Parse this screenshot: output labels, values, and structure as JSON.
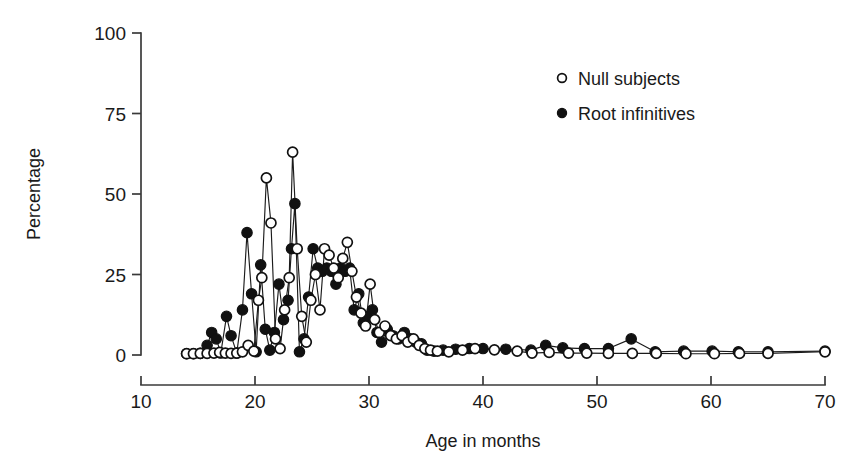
{
  "chart_data": {
    "type": "scatter",
    "title": "",
    "xlabel": "Age in months",
    "ylabel": "Percentage",
    "xlim": [
      10,
      70
    ],
    "ylim": [
      0,
      100
    ],
    "xticks": [
      10,
      20,
      30,
      40,
      50,
      60,
      70
    ],
    "yticks": [
      0,
      25,
      50,
      75,
      100
    ],
    "xtick_labels": [
      "10",
      "20",
      "30",
      "40",
      "50",
      "60",
      "70"
    ],
    "ytick_labels": [
      "0",
      "25",
      "50",
      "75",
      "100"
    ],
    "grid": false,
    "legend_position": "upper right",
    "marker_style": {
      "null_subjects": "open-circle",
      "root_infinitives": "filled-circle"
    },
    "series": [
      {
        "name": "Null subjects",
        "marker": "open-circle",
        "color": "#111111",
        "points": [
          [
            14.0,
            0.4
          ],
          [
            14.6,
            0.4
          ],
          [
            15.2,
            0.5
          ],
          [
            15.8,
            0.5
          ],
          [
            16.4,
            0.6
          ],
          [
            16.9,
            0.8
          ],
          [
            17.4,
            0.6
          ],
          [
            17.9,
            0.5
          ],
          [
            18.4,
            0.6
          ],
          [
            18.9,
            1.0
          ],
          [
            19.4,
            3.0
          ],
          [
            19.9,
            1.2
          ],
          [
            20.3,
            17.0
          ],
          [
            20.6,
            24.0
          ],
          [
            21.0,
            55.0
          ],
          [
            21.4,
            41.0
          ],
          [
            21.8,
            5.0
          ],
          [
            22.2,
            2.0
          ],
          [
            22.6,
            14.0
          ],
          [
            23.0,
            24.0
          ],
          [
            23.3,
            63.0
          ],
          [
            23.7,
            33.0
          ],
          [
            24.1,
            12.0
          ],
          [
            24.5,
            4.0
          ],
          [
            24.9,
            17.0
          ],
          [
            25.3,
            25.0
          ],
          [
            25.7,
            14.0
          ],
          [
            26.1,
            33.0
          ],
          [
            26.5,
            31.0
          ],
          [
            26.9,
            27.0
          ],
          [
            27.3,
            24.0
          ],
          [
            27.7,
            30.0
          ],
          [
            28.1,
            35.0
          ],
          [
            28.5,
            26.0
          ],
          [
            28.9,
            18.0
          ],
          [
            29.3,
            13.0
          ],
          [
            29.7,
            9.0
          ],
          [
            30.1,
            22.0
          ],
          [
            30.5,
            11.0
          ],
          [
            30.9,
            7.0
          ],
          [
            31.4,
            9.0
          ],
          [
            31.9,
            6.0
          ],
          [
            32.4,
            5.0
          ],
          [
            32.9,
            6.0
          ],
          [
            33.4,
            4.0
          ],
          [
            33.9,
            5.0
          ],
          [
            34.4,
            3.0
          ],
          [
            34.9,
            2.0
          ],
          [
            35.4,
            1.5
          ],
          [
            36.0,
            1.2
          ],
          [
            37.0,
            1.0
          ],
          [
            38.2,
            1.5
          ],
          [
            39.3,
            2.0
          ],
          [
            41.0,
            1.6
          ],
          [
            43.0,
            1.2
          ],
          [
            44.3,
            0.6
          ],
          [
            45.8,
            0.8
          ],
          [
            47.5,
            0.6
          ],
          [
            49.1,
            0.6
          ],
          [
            51.0,
            0.5
          ],
          [
            53.1,
            0.5
          ],
          [
            55.2,
            0.5
          ],
          [
            57.8,
            0.4
          ],
          [
            60.3,
            0.4
          ],
          [
            62.5,
            0.5
          ],
          [
            65.0,
            0.5
          ],
          [
            70.0,
            1.0
          ]
        ]
      },
      {
        "name": "Root infinitives",
        "marker": "filled-circle",
        "color": "#111111",
        "points": [
          [
            14.0,
            0.4
          ],
          [
            14.6,
            0.4
          ],
          [
            15.2,
            0.5
          ],
          [
            15.8,
            3.0
          ],
          [
            16.2,
            7.0
          ],
          [
            16.6,
            5.0
          ],
          [
            17.0,
            0.6
          ],
          [
            17.5,
            12.0
          ],
          [
            17.9,
            6.0
          ],
          [
            18.4,
            0.6
          ],
          [
            18.9,
            14.0
          ],
          [
            19.3,
            38.0
          ],
          [
            19.7,
            19.0
          ],
          [
            20.1,
            1.0
          ],
          [
            20.5,
            28.0
          ],
          [
            20.9,
            8.0
          ],
          [
            21.3,
            1.5
          ],
          [
            21.7,
            7.0
          ],
          [
            22.1,
            22.0
          ],
          [
            22.5,
            11.0
          ],
          [
            22.9,
            17.0
          ],
          [
            23.2,
            33.0
          ],
          [
            23.5,
            47.0
          ],
          [
            23.9,
            1.0
          ],
          [
            24.3,
            5.0
          ],
          [
            24.7,
            18.0
          ],
          [
            25.1,
            33.0
          ],
          [
            25.5,
            27.0
          ],
          [
            25.9,
            26.0
          ],
          [
            26.3,
            27.0
          ],
          [
            26.7,
            26.0
          ],
          [
            27.1,
            22.0
          ],
          [
            27.5,
            27.0
          ],
          [
            27.9,
            26.0
          ],
          [
            28.3,
            27.0
          ],
          [
            28.7,
            14.0
          ],
          [
            29.1,
            19.0
          ],
          [
            29.5,
            10.0
          ],
          [
            29.9,
            12.0
          ],
          [
            30.3,
            14.0
          ],
          [
            30.7,
            7.0
          ],
          [
            31.1,
            4.0
          ],
          [
            31.6,
            8.0
          ],
          [
            32.1,
            6.0
          ],
          [
            32.6,
            5.0
          ],
          [
            33.1,
            7.0
          ],
          [
            33.6,
            5.0
          ],
          [
            34.1,
            4.0
          ],
          [
            34.6,
            3.5
          ],
          [
            35.1,
            1.5
          ],
          [
            35.7,
            1.2
          ],
          [
            36.5,
            1.5
          ],
          [
            37.6,
            1.8
          ],
          [
            38.8,
            2.0
          ],
          [
            40.0,
            2.0
          ],
          [
            42.0,
            1.8
          ],
          [
            44.2,
            1.5
          ],
          [
            45.5,
            3.0
          ],
          [
            47.0,
            2.2
          ],
          [
            48.9,
            2.0
          ],
          [
            51.0,
            2.0
          ],
          [
            53.0,
            5.0
          ],
          [
            55.1,
            1.0
          ],
          [
            57.6,
            1.2
          ],
          [
            60.1,
            1.2
          ],
          [
            62.4,
            1.0
          ],
          [
            65.0,
            1.0
          ],
          [
            70.0,
            1.2
          ]
        ]
      }
    ]
  },
  "legend": {
    "items": [
      {
        "label": "Null subjects",
        "marker": "open-circle"
      },
      {
        "label": "Root infinitives",
        "marker": "filled-circle"
      }
    ]
  },
  "axes": {
    "y_title": "Percentage",
    "x_title": "Age in months"
  },
  "colors": {
    "ink": "#111111",
    "axis": "#3a3a3a",
    "background": "#ffffff"
  }
}
